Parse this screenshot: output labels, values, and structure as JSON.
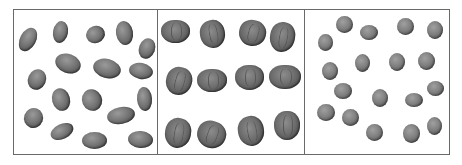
{
  "image": {
    "description": "Three side-by-side bordered panels showing grayscale illustrations of seeds/nuts",
    "panels": [
      {
        "name": "beans",
        "count": 18,
        "shape": "elongated oval"
      },
      {
        "name": "walnuts",
        "count": 12,
        "shape": "wrinkled round, arranged 3 rows x 4"
      },
      {
        "name": "peas",
        "count": 19,
        "shape": "small round"
      }
    ]
  }
}
